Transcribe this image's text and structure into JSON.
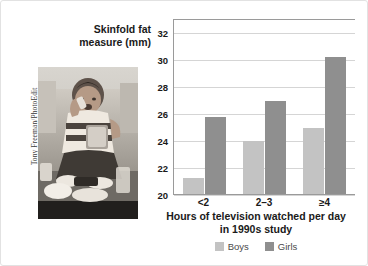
{
  "figure": {
    "photo": {
      "credit": "Tony Freeman/PhotoEdit",
      "alt_description": "overweight teenager sitting on a couch eating snacks surrounded by food wrappers"
    }
  },
  "chart_data": {
    "type": "bar",
    "title": "",
    "categories": [
      "<2",
      "2–3",
      "≥4"
    ],
    "series": [
      {
        "name": "Boys",
        "color": "#c3c3c3",
        "values": [
          21.2,
          23.9,
          24.9
        ]
      },
      {
        "name": "Girls",
        "color": "#8f8f8f",
        "values": [
          25.7,
          26.9,
          30.1
        ]
      }
    ],
    "xlabel": "Hours of television watched per day in 1990s study",
    "xlabel_line1": "Hours of television watched per day",
    "xlabel_line2": "in 1990s study",
    "ylabel": "Skinfold fat measure (mm)",
    "ylabel_line1": "Skinfold fat",
    "ylabel_line2": "measure (mm)",
    "ylim": [
      20,
      33
    ],
    "yticks": [
      20,
      22,
      24,
      26,
      28,
      30,
      32
    ],
    "ytick_labels": [
      "20",
      "22",
      "24",
      "26",
      "28",
      "30",
      "32"
    ],
    "grid": true,
    "legend_position": "bottom",
    "legend": [
      "Boys",
      "Girls"
    ]
  }
}
